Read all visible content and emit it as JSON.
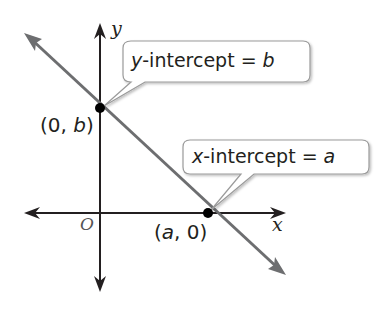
{
  "diagram": {
    "type": "coordinate-plane-line",
    "axes": {
      "x_label": "x",
      "y_label": "y",
      "origin_label": "O"
    },
    "points": [
      {
        "label_prefix": "(0, ",
        "label_var": "b",
        "label_suffix": ")",
        "name": "y-intercept point"
      },
      {
        "label_prefix": "(",
        "label_var": "a",
        "label_suffix": ", 0)",
        "name": "x-intercept point"
      }
    ],
    "callouts": [
      {
        "var_pre": "y",
        "text": "-intercept = ",
        "var_post": "b"
      },
      {
        "var_pre": "x",
        "text": "-intercept = ",
        "var_post": "a"
      }
    ],
    "colors": {
      "axis": "#231f20",
      "line": "#6d6e70",
      "point": "#000000",
      "bubble_border": "#9a9a9a",
      "text": "#231f20"
    }
  }
}
